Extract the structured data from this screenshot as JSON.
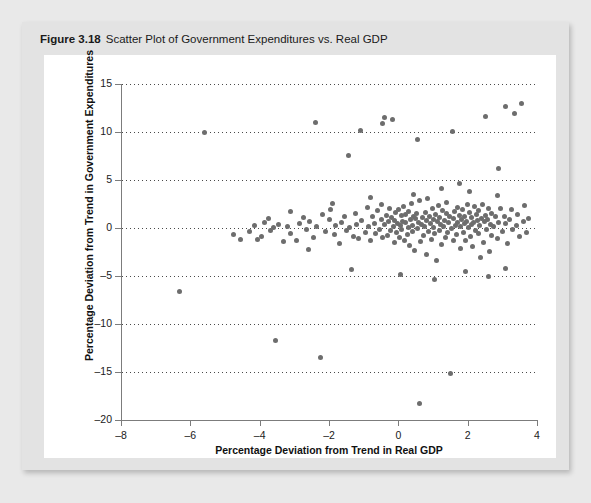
{
  "figure": {
    "number": "Figure 3.18",
    "caption": "Scatter Plot of Government Expenditures vs. Real GDP"
  },
  "colors": {
    "page_background": "#e9e9e9",
    "card_background": "#e3e3e3",
    "panel_background": "#ffffff",
    "point_color": "#6d6d6d",
    "axis_color": "#7c7c7c",
    "gridline_color": "#4a4a4a"
  },
  "chart_data": {
    "type": "scatter",
    "title": "Scatter Plot of Government Expenditures vs. Real GDP",
    "xlabel": "Percentage Deviation from Trend in Real GDP",
    "ylabel": "Percentage Deviation from Trend in Government Expenditures",
    "xlim": [
      -8,
      4
    ],
    "ylim": [
      -20,
      15
    ],
    "xticks": [
      -8,
      -6,
      -4,
      -2,
      0,
      2,
      4
    ],
    "xtick_labels": [
      "–8",
      "–6",
      "–4",
      "–2",
      "0",
      "2",
      "4"
    ],
    "yticks": [
      -20,
      -15,
      -10,
      -5,
      0,
      5,
      10,
      15
    ],
    "ytick_labels": [
      "–20",
      "–15",
      "–10",
      "–5",
      "0",
      "5",
      "10",
      "15"
    ],
    "grid": true,
    "gridlines_on": "y",
    "grid_style": "dotted",
    "legend": null,
    "marker": "circle",
    "marker_size": 5,
    "n_points": 208,
    "points": [
      [
        -6.3,
        -6.6
      ],
      [
        -4.75,
        -0.65
      ],
      [
        -4.55,
        -1.15
      ],
      [
        -4.3,
        -0.35
      ],
      [
        -4.15,
        0.25
      ],
      [
        -4.05,
        -1.2
      ],
      [
        -3.95,
        -0.9
      ],
      [
        -3.85,
        0.55
      ],
      [
        -3.75,
        0.95
      ],
      [
        -3.7,
        -0.3
      ],
      [
        -3.6,
        0.1
      ],
      [
        -3.55,
        -11.7
      ],
      [
        -3.45,
        0.35
      ],
      [
        -3.3,
        -1.45
      ],
      [
        -3.2,
        0.2
      ],
      [
        -3.1,
        -0.55
      ],
      [
        -2.95,
        -1.3
      ],
      [
        -2.85,
        0.45
      ],
      [
        -2.75,
        1.05
      ],
      [
        -2.65,
        -0.2
      ],
      [
        -2.55,
        0.7
      ],
      [
        -2.45,
        -0.95
      ],
      [
        -2.35,
        0.15
      ],
      [
        -2.25,
        -13.5
      ],
      [
        -2.2,
        1.4
      ],
      [
        -2.1,
        -0.4
      ],
      [
        -2.0,
        0.85
      ],
      [
        -1.95,
        1.95
      ],
      [
        -1.85,
        -0.7
      ],
      [
        -1.8,
        0.3
      ],
      [
        -1.7,
        -1.6
      ],
      [
        -1.65,
        0.6
      ],
      [
        -1.55,
        1.25
      ],
      [
        -1.5,
        -0.25
      ],
      [
        -1.45,
        7.6
      ],
      [
        -1.4,
        0.05
      ],
      [
        -1.3,
        -0.85
      ],
      [
        -1.25,
        1.55
      ],
      [
        -1.2,
        0.4
      ],
      [
        -1.15,
        -1.1
      ],
      [
        -1.1,
        10.2
      ],
      [
        -1.05,
        0.75
      ],
      [
        -0.95,
        -0.45
      ],
      [
        -0.9,
        2.1
      ],
      [
        -0.85,
        0.2
      ],
      [
        -0.8,
        -1.35
      ],
      [
        -0.75,
        1.15
      ],
      [
        -0.7,
        0.5
      ],
      [
        -0.65,
        -0.6
      ],
      [
        -0.6,
        1.8
      ],
      [
        -0.55,
        -0.15
      ],
      [
        -0.5,
        0.9
      ],
      [
        -0.48,
        2.45
      ],
      [
        -0.45,
        -1.0
      ],
      [
        -0.4,
        0.35
      ],
      [
        -0.35,
        1.35
      ],
      [
        -0.32,
        -0.75
      ],
      [
        -0.28,
        0.65
      ],
      [
        -0.25,
        2.0
      ],
      [
        -0.22,
        -0.3
      ],
      [
        -0.2,
        1.1
      ],
      [
        -0.18,
        11.3
      ],
      [
        -0.15,
        0.15
      ],
      [
        -0.12,
        -1.55
      ],
      [
        -0.1,
        0.8
      ],
      [
        -0.08,
        1.6
      ],
      [
        -0.05,
        -0.5
      ],
      [
        -0.02,
        0.45
      ],
      [
        0.0,
        1.9
      ],
      [
        0.02,
        -0.95
      ],
      [
        0.05,
        0.25
      ],
      [
        0.08,
        1.3
      ],
      [
        0.1,
        -0.2
      ],
      [
        0.12,
        0.7
      ],
      [
        0.15,
        2.25
      ],
      [
        0.18,
        -1.25
      ],
      [
        0.2,
        0.55
      ],
      [
        0.22,
        1.45
      ],
      [
        0.25,
        -0.65
      ],
      [
        0.28,
        0.1
      ],
      [
        0.3,
        1.75
      ],
      [
        0.32,
        -1.8
      ],
      [
        0.35,
        0.85
      ],
      [
        0.38,
        2.6
      ],
      [
        0.4,
        -0.4
      ],
      [
        0.42,
        0.3
      ],
      [
        0.45,
        1.2
      ],
      [
        0.48,
        -2.35
      ],
      [
        0.5,
        0.95
      ],
      [
        0.52,
        1.55
      ],
      [
        0.55,
        -0.1
      ],
      [
        0.58,
        0.6
      ],
      [
        0.6,
        -18.3
      ],
      [
        0.62,
        2.85
      ],
      [
        0.65,
        -1.45
      ],
      [
        0.68,
        0.4
      ],
      [
        0.7,
        1.05
      ],
      [
        0.72,
        -0.8
      ],
      [
        0.75,
        0.2
      ],
      [
        0.78,
        1.65
      ],
      [
        0.8,
        -2.8
      ],
      [
        0.82,
        0.75
      ],
      [
        0.85,
        3.1
      ],
      [
        0.88,
        -0.35
      ],
      [
        0.9,
        1.25
      ],
      [
        0.92,
        0.5
      ],
      [
        0.95,
        -1.15
      ],
      [
        0.98,
        2.05
      ],
      [
        1.0,
        0.05
      ],
      [
        1.02,
        0.9
      ],
      [
        1.05,
        -0.55
      ],
      [
        1.08,
        1.4
      ],
      [
        1.1,
        -3.4
      ],
      [
        1.12,
        0.65
      ],
      [
        1.15,
        2.35
      ],
      [
        1.18,
        -0.25
      ],
      [
        1.2,
        1.1
      ],
      [
        1.22,
        0.35
      ],
      [
        1.25,
        -1.7
      ],
      [
        1.28,
        1.85
      ],
      [
        1.3,
        0.15
      ],
      [
        1.32,
        0.8
      ],
      [
        1.35,
        -0.95
      ],
      [
        1.38,
        1.5
      ],
      [
        1.4,
        2.7
      ],
      [
        1.42,
        -0.45
      ],
      [
        1.45,
        0.55
      ],
      [
        1.48,
        1.2
      ],
      [
        1.5,
        -15.2
      ],
      [
        1.52,
        0.0
      ],
      [
        1.55,
        10.1
      ],
      [
        1.58,
        0.95
      ],
      [
        1.6,
        -1.35
      ],
      [
        1.62,
        1.7
      ],
      [
        1.65,
        0.3
      ],
      [
        1.68,
        -0.7
      ],
      [
        1.7,
        2.15
      ],
      [
        1.72,
        0.6
      ],
      [
        1.75,
        1.35
      ],
      [
        1.78,
        -2.1
      ],
      [
        1.8,
        0.2
      ],
      [
        1.82,
        0.85
      ],
      [
        1.85,
        1.95
      ],
      [
        1.88,
        -0.5
      ],
      [
        1.9,
        0.45
      ],
      [
        1.92,
        1.15
      ],
      [
        1.95,
        -1.25
      ],
      [
        1.98,
        0.7
      ],
      [
        2.0,
        2.5
      ],
      [
        2.02,
        0.1
      ],
      [
        2.05,
        1.6
      ],
      [
        2.08,
        -0.85
      ],
      [
        2.1,
        0.35
      ],
      [
        2.12,
        1.05
      ],
      [
        2.15,
        -1.95
      ],
      [
        2.18,
        0.55
      ],
      [
        2.2,
        2.2
      ],
      [
        2.22,
        -0.3
      ],
      [
        2.25,
        1.45
      ],
      [
        2.28,
        0.8
      ],
      [
        2.3,
        -0.6
      ],
      [
        2.32,
        1.8
      ],
      [
        2.35,
        0.25
      ],
      [
        2.38,
        -3.1
      ],
      [
        2.4,
        1.0
      ],
      [
        2.42,
        2.4
      ],
      [
        2.45,
        -1.5
      ],
      [
        2.48,
        0.65
      ],
      [
        2.5,
        11.6
      ],
      [
        2.52,
        1.3
      ],
      [
        2.55,
        -0.15
      ],
      [
        2.58,
        0.9
      ],
      [
        2.6,
        2.0
      ],
      [
        2.62,
        -2.45
      ],
      [
        2.65,
        0.4
      ],
      [
        2.68,
        1.55
      ],
      [
        2.7,
        -0.75
      ],
      [
        2.75,
        0.2
      ],
      [
        2.8,
        1.25
      ],
      [
        2.85,
        -1.05
      ],
      [
        2.88,
        6.2
      ],
      [
        2.9,
        0.6
      ],
      [
        2.95,
        2.05
      ],
      [
        3.0,
        -0.35
      ],
      [
        3.05,
        1.15
      ],
      [
        3.08,
        12.7
      ],
      [
        3.1,
        0.45
      ],
      [
        3.15,
        -1.6
      ],
      [
        3.2,
        0.85
      ],
      [
        3.25,
        1.9
      ],
      [
        3.3,
        -0.2
      ],
      [
        3.35,
        11.95
      ],
      [
        3.4,
        0.3
      ],
      [
        3.45,
        1.4
      ],
      [
        3.5,
        -0.9
      ],
      [
        3.55,
        13.0
      ],
      [
        3.6,
        0.7
      ],
      [
        3.65,
        2.3
      ],
      [
        3.7,
        -0.45
      ],
      [
        3.75,
        1.0
      ],
      [
        -5.6,
        9.9
      ],
      [
        -2.4,
        11.0
      ],
      [
        -0.45,
        10.85
      ],
      [
        -0.4,
        11.55
      ],
      [
        0.55,
        9.2
      ],
      [
        -1.35,
        -4.3
      ],
      [
        0.05,
        -4.85
      ],
      [
        1.05,
        -5.4
      ],
      [
        1.95,
        -4.55
      ],
      [
        2.6,
        -5.1
      ],
      [
        3.1,
        -4.2
      ],
      [
        0.45,
        3.5
      ],
      [
        1.25,
        4.1
      ],
      [
        2.05,
        3.8
      ],
      [
        -0.8,
        3.2
      ],
      [
        1.75,
        4.6
      ],
      [
        2.85,
        3.4
      ],
      [
        -3.1,
        1.7
      ],
      [
        -2.6,
        -2.2
      ],
      [
        -1.9,
        2.55
      ]
    ]
  }
}
